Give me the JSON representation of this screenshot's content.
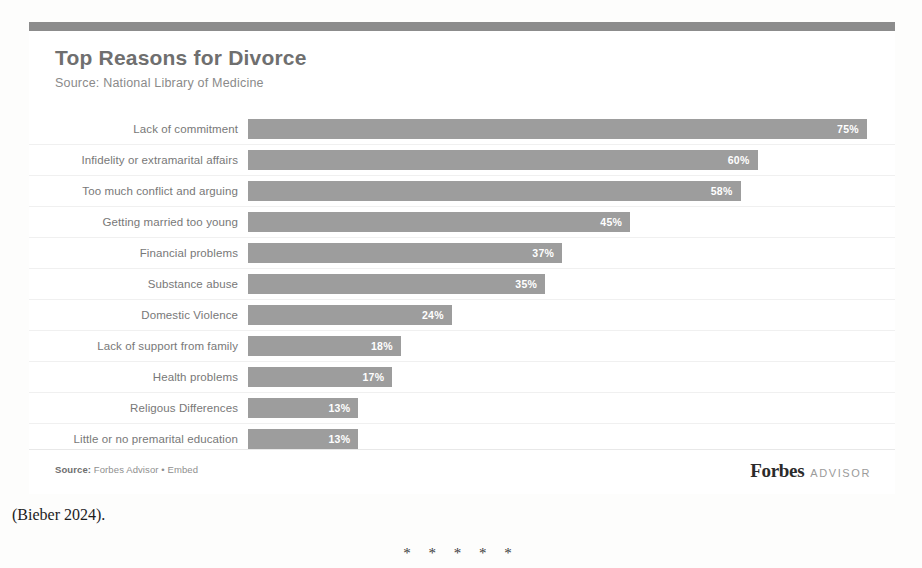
{
  "chart_card": {
    "title": "Top Reasons for Divorce",
    "subtitle": "Source: National Library of Medicine",
    "footer_source": "Source: Forbes Advisor • Embed",
    "footer_source_prefix": "Source:",
    "footer_source_rest": " Forbes Advisor • Embed",
    "brand_name": "Forbes",
    "brand_suffix": "ADVISOR",
    "accent_color": "#8c8c8c",
    "bar_color": "#9d9d9d",
    "value_text_color": "#ffffff"
  },
  "document": {
    "citation": "(Bieber 2024).",
    "section_break": "* * * * *"
  },
  "chart_data": {
    "type": "bar",
    "orientation": "horizontal",
    "title": "Top Reasons for Divorce",
    "subtitle": "Source: National Library of Medicine",
    "xlabel": "",
    "ylabel": "",
    "xlim": [
      0,
      100
    ],
    "grid": false,
    "legend": "none",
    "value_suffix": "%",
    "categories": [
      "Lack of commitment",
      "Infidelity or extramarital affairs",
      "Too much conflict and arguing",
      "Getting married too young",
      "Financial problems",
      "Substance abuse",
      "Domestic Violence",
      "Lack of support from family",
      "Health problems",
      "Religous Differences",
      "Little or no premarital education"
    ],
    "values": [
      75,
      60,
      58,
      45,
      37,
      35,
      24,
      18,
      17,
      13,
      13
    ],
    "labels": [
      "75%",
      "60%",
      "58%",
      "45%",
      "37%",
      "35%",
      "24%",
      "18%",
      "17%",
      "13%",
      "13%"
    ]
  }
}
